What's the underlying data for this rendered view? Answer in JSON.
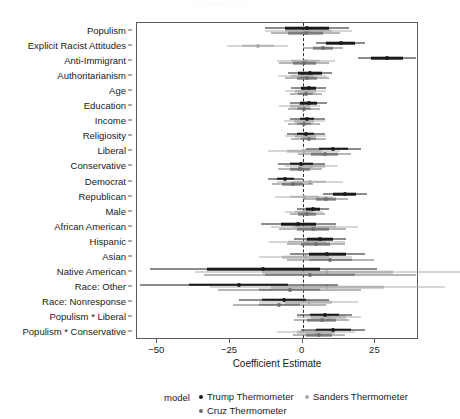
{
  "chart_data": {
    "type": "scatter",
    "title": "Coefficient Plot",
    "xlabel": "Coefficient Estimate",
    "ylabel": "",
    "xlim": [
      -57,
      40
    ],
    "xticks": [
      -50,
      -25,
      0,
      25
    ],
    "xticklabels": [
      "-50",
      "-25",
      "0",
      "25"
    ],
    "grid": false,
    "zero_reference_line": 0,
    "legend_title": "model",
    "legend_position": "bottom",
    "categories": [
      "Populism",
      "Explicit Racist Attitudes",
      "Anti-Immigrant",
      "Authoritarianism",
      "Age",
      "Education",
      "Income",
      "Religiosity",
      "Liberal",
      "Conservative",
      "Democrat",
      "Republican",
      "Male",
      "African American",
      "Hispanic",
      "Asian",
      "Native American",
      "Race: Other",
      "Race: Nonresponse",
      "Populism * Liberal",
      "Populism * Conservative"
    ],
    "series": [
      {
        "name": "Trump Thermometer",
        "color": "#1a1a1a",
        "estimates": [
          1.5,
          13.0,
          29.0,
          2.5,
          2.0,
          2.0,
          1.5,
          1.0,
          10.5,
          -0.5,
          -6.0,
          14.5,
          3.5,
          -1.5,
          6.0,
          8.5,
          -13.5,
          -22.0,
          -6.5,
          7.5,
          10.5
        ],
        "ci_low": [
          -13.0,
          4.5,
          19.0,
          -5.0,
          -4.0,
          -4.5,
          -4.5,
          -5.5,
          1.0,
          -8.5,
          -12.0,
          7.0,
          -2.0,
          -14.5,
          -3.0,
          -4.5,
          -52.5,
          -56.0,
          -22.0,
          -2.0,
          -0.5
        ],
        "ci_high": [
          16.0,
          21.5,
          39.0,
          10.0,
          8.0,
          8.5,
          7.5,
          7.5,
          20.0,
          7.5,
          0.0,
          22.0,
          9.0,
          11.5,
          15.0,
          21.5,
          25.5,
          12.0,
          9.0,
          17.0,
          21.5
        ],
        "ci_inner_low": [
          -6.0,
          8.0,
          23.5,
          -1.5,
          -0.5,
          -1.0,
          -1.0,
          -2.0,
          5.5,
          -4.5,
          -9.0,
          10.5,
          1.0,
          -7.5,
          1.5,
          2.0,
          -33.0,
          -39.0,
          -14.0,
          2.5,
          4.5
        ],
        "ci_inner_high": [
          9.0,
          18.0,
          34.5,
          6.5,
          4.5,
          5.0,
          4.0,
          4.0,
          15.5,
          3.5,
          -3.0,
          18.5,
          6.0,
          4.5,
          10.5,
          15.0,
          6.0,
          -5.0,
          1.0,
          12.5,
          16.5
        ]
      },
      {
        "name": "Sanders Thermometer",
        "color": "#adadad",
        "estimates": [
          2.0,
          -15.5,
          1.0,
          0.0,
          1.0,
          -1.0,
          0.5,
          1.0,
          0.5,
          3.0,
          2.5,
          0.5,
          0.5,
          4.0,
          1.5,
          1.0,
          8.5,
          8.5,
          2.0,
          9.0,
          4.5
        ],
        "ci_low": [
          -13.0,
          -26.0,
          -9.0,
          -8.5,
          -6.0,
          -8.0,
          -6.5,
          -6.0,
          -12.0,
          -6.0,
          -9.0,
          -9.5,
          -6.0,
          -11.0,
          -11.5,
          -15.0,
          -37.0,
          -32.0,
          -15.0,
          -2.0,
          -9.0
        ],
        "ci_high": [
          17.0,
          -5.0,
          11.0,
          8.5,
          8.0,
          6.0,
          7.5,
          8.0,
          13.0,
          12.0,
          14.0,
          10.5,
          7.0,
          19.0,
          14.5,
          17.0,
          54.0,
          49.0,
          19.0,
          20.0,
          18.0
        ],
        "ci_inner_low": [
          -6.0,
          -21.0,
          -4.0,
          -4.0,
          -2.5,
          -4.5,
          -3.0,
          -2.5,
          -5.5,
          -1.5,
          -3.0,
          -4.5,
          -2.5,
          -3.5,
          -5.0,
          -7.0,
          -14.0,
          -11.0,
          -6.0,
          3.0,
          -2.0
        ],
        "ci_inner_high": [
          10.0,
          -10.0,
          6.0,
          4.0,
          4.5,
          2.5,
          4.0,
          4.5,
          6.5,
          7.5,
          8.0,
          5.5,
          3.5,
          11.5,
          8.0,
          9.0,
          31.0,
          28.0,
          10.0,
          15.0,
          11.0
        ]
      },
      {
        "name": "Cruz Thermometer",
        "color": "#6e6e6e",
        "estimates": [
          1.0,
          7.0,
          0.5,
          1.5,
          1.0,
          0.5,
          0.5,
          2.0,
          7.5,
          -1.0,
          -3.5,
          8.0,
          1.5,
          3.5,
          4.5,
          9.5,
          2.5,
          -4.5,
          -8.0,
          6.5,
          5.5
        ],
        "ci_low": [
          -11.0,
          0.0,
          -8.0,
          -6.0,
          -4.5,
          -5.0,
          -5.0,
          -4.0,
          -1.5,
          -8.5,
          -10.5,
          0.5,
          -4.5,
          -8.0,
          -5.5,
          -5.5,
          -34.0,
          -29.0,
          -24.0,
          -3.0,
          -3.5
        ],
        "ci_high": [
          13.0,
          14.0,
          9.0,
          9.0,
          6.5,
          6.0,
          6.0,
          8.0,
          16.5,
          6.5,
          3.5,
          15.5,
          7.5,
          15.0,
          14.5,
          24.5,
          39.0,
          20.0,
          8.0,
          16.0,
          14.5
        ],
        "ci_inner_low": [
          -5.0,
          3.5,
          -3.5,
          -2.0,
          -1.5,
          -2.0,
          -2.0,
          -0.5,
          3.0,
          -4.5,
          -7.0,
          4.5,
          -1.5,
          -2.0,
          -0.5,
          2.0,
          -13.0,
          -15.0,
          -15.0,
          1.5,
          1.0
        ],
        "ci_inner_high": [
          7.0,
          10.5,
          4.5,
          5.0,
          3.5,
          3.0,
          3.0,
          4.5,
          12.0,
          2.5,
          0.0,
          11.5,
          4.5,
          9.0,
          9.5,
          17.0,
          18.0,
          6.0,
          -1.0,
          11.5,
          10.0
        ]
      }
    ]
  },
  "legend": {
    "title": "model",
    "items": [
      {
        "label": "Trump Thermometer",
        "color": "#1a1a1a"
      },
      {
        "label": "Sanders Thermometer",
        "color": "#adadad"
      },
      {
        "label": "Cruz Thermometer",
        "color": "#6e6e6e"
      }
    ]
  },
  "axis": {
    "x_title": "Coefficient Estimate"
  }
}
